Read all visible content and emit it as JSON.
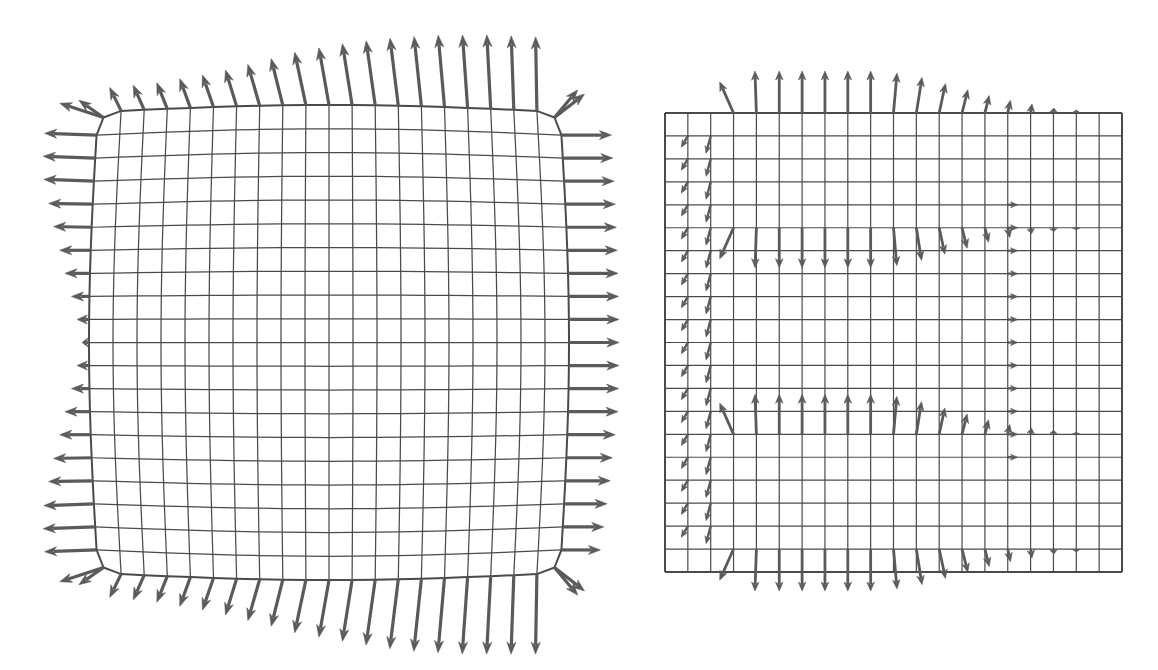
{
  "figure": {
    "width": 1158,
    "height": 670,
    "background": "#ffffff",
    "kind": "vector-field-on-deformed-mesh",
    "panel_count": 2,
    "stroke_color": "#555555",
    "grid_color": "#4a4a4a",
    "arrow_color": "#5a5a5a"
  },
  "chart_data": {
    "type": "quiver",
    "title": "",
    "subtitle": "",
    "xlabel": "",
    "ylabel": "",
    "grid": true,
    "legend": "none",
    "panels": [
      {
        "name": "left-panel",
        "label": "",
        "description": "Bulged/deformed square mesh with outward-pointing traction arrows attached only to the boundary nodes",
        "mesh": {
          "nx": 20,
          "ny": 20,
          "x0": 98,
          "y0": 112,
          "x1": 560,
          "y1": 573,
          "bulge_x": 9,
          "bulge_y": 7,
          "corner_cut": 10
        },
        "arrows": {
          "color": "#5a5a5a",
          "head_len": 12,
          "head_w": 9,
          "shaft_w": 3.2,
          "edges": [
            {
              "edge": "left",
              "direction_deg": 180,
              "count": 21,
              "lengths": [
                46,
                52,
                52,
                50,
                44,
                38,
                31,
                25,
                18,
                12,
                7,
                12,
                18,
                25,
                31,
                38,
                44,
                50,
                52,
                52,
                46
              ],
              "tilt_deg": [
                18,
                2,
                2,
                2,
                1,
                1,
                0,
                0,
                0,
                0,
                0,
                0,
                0,
                0,
                0,
                -1,
                -1,
                -2,
                -2,
                -2,
                -18
              ]
            },
            {
              "edge": "right",
              "direction_deg": 0,
              "count": 21,
              "lengths": [
                38,
                50,
                50,
                50,
                50,
                50,
                50,
                50,
                50,
                50,
                50,
                50,
                50,
                50,
                48,
                46,
                45,
                43,
                41,
                39,
                38
              ],
              "tilt_deg": [
                -38,
                0,
                0,
                0,
                0,
                0,
                0,
                0,
                0,
                0,
                0,
                0,
                0,
                0,
                0,
                0,
                0,
                0,
                0,
                0,
                38
              ]
            },
            {
              "edge": "top",
              "direction_deg": 270,
              "count": 21,
              "lengths": [
                30,
                26,
                27,
                28,
                31,
                34,
                38,
                43,
                48,
                54,
                58,
                62,
                65,
                68,
                70,
                72,
                73,
                74,
                74,
                74,
                36
              ],
              "tilt_deg": [
                -55,
                -26,
                -24,
                -22,
                -20,
                -19,
                -17,
                -16,
                -14,
                -12,
                -10,
                -9,
                -8,
                -7,
                -6,
                -5,
                -4,
                -3,
                -2,
                -1,
                40
              ]
            },
            {
              "edge": "bottom",
              "direction_deg": 90,
              "count": 21,
              "lengths": [
                30,
                26,
                27,
                28,
                31,
                34,
                38,
                43,
                48,
                54,
                58,
                62,
                66,
                70,
                73,
                75,
                77,
                78,
                79,
                80,
                36
              ],
              "tilt_deg": [
                55,
                26,
                24,
                22,
                20,
                19,
                17,
                16,
                14,
                12,
                10,
                9,
                8,
                7,
                6,
                5,
                4,
                3,
                2,
                1,
                -40
              ]
            }
          ]
        }
      },
      {
        "name": "right-panel",
        "label": "",
        "description": "Regular square mesh with a residual/error vector field concentrated on an inner rectangular interface; arrows point up along the outer top band, down along the inner upper interface, up along the inner lower interface, and down along the outer bottom band",
        "mesh": {
          "nx": 20,
          "ny": 20,
          "x0": 665,
          "y0": 113,
          "x1": 1122,
          "y1": 572
        },
        "arrows": {
          "color": "#5a5a5a",
          "head_len": 9,
          "head_w": 7.5,
          "shaft_w": 2.8,
          "bands": [
            {
              "band": "outer-top",
              "row": 0,
              "direction_deg": 270,
              "cols": [
                3,
                4,
                5,
                6,
                7,
                8,
                9,
                10,
                11,
                12,
                13,
                14,
                15,
                16,
                17,
                18
              ],
              "lengths": [
                34,
                42,
                42,
                42,
                42,
                42,
                42,
                40,
                36,
                30,
                24,
                18,
                13,
                9,
                5,
                3
              ],
              "tilt_deg": [
                -24,
                -2,
                0,
                0,
                0,
                0,
                0,
                5,
                9,
                12,
                14,
                14,
                12,
                9,
                5,
                2
              ]
            },
            {
              "band": "inner-top",
              "row": 5,
              "direction_deg": 90,
              "cols": [
                3,
                4,
                5,
                6,
                7,
                8,
                9,
                10,
                11,
                12,
                13,
                14,
                15,
                16,
                17,
                18
              ],
              "lengths": [
                34,
                40,
                40,
                40,
                40,
                40,
                40,
                38,
                33,
                27,
                21,
                15,
                10,
                6,
                4,
                2
              ],
              "tilt_deg": [
                24,
                2,
                0,
                0,
                0,
                0,
                0,
                -5,
                -9,
                -12,
                -14,
                -14,
                -12,
                -9,
                -5,
                -2
              ]
            },
            {
              "band": "inner-bottom",
              "row": 14,
              "direction_deg": 270,
              "cols": [
                3,
                4,
                5,
                6,
                7,
                8,
                9,
                10,
                11,
                12,
                13,
                14,
                15,
                16,
                17,
                18
              ],
              "lengths": [
                34,
                40,
                40,
                40,
                40,
                40,
                40,
                38,
                33,
                27,
                21,
                15,
                10,
                6,
                4,
                2
              ],
              "tilt_deg": [
                -24,
                -2,
                0,
                0,
                0,
                0,
                0,
                5,
                9,
                12,
                14,
                14,
                12,
                9,
                5,
                2
              ]
            },
            {
              "band": "outer-bottom",
              "row": 19,
              "direction_deg": 90,
              "cols": [
                3,
                4,
                5,
                6,
                7,
                8,
                9,
                10,
                11,
                12,
                13,
                14,
                15,
                16,
                17,
                18
              ],
              "lengths": [
                34,
                42,
                42,
                42,
                42,
                42,
                42,
                40,
                36,
                30,
                24,
                18,
                13,
                9,
                5,
                3
              ],
              "tilt_deg": [
                24,
                2,
                0,
                0,
                0,
                0,
                0,
                -5,
                -9,
                -12,
                -14,
                -14,
                -12,
                -9,
                -5,
                -2
              ]
            },
            {
              "band": "left-outer-column",
              "col": 1,
              "direction_deg": 120,
              "rows": [
                1,
                2,
                3,
                4,
                5,
                6,
                7,
                8,
                9,
                10,
                11,
                12,
                13,
                14,
                15,
                16,
                17,
                18
              ],
              "length": 13
            },
            {
              "band": "left-inner-column",
              "col": 2,
              "direction_deg": 105,
              "rows": [
                1,
                2,
                3,
                4,
                5,
                6,
                7,
                8,
                9,
                10,
                11,
                12,
                13,
                14,
                15,
                16,
                17,
                18
              ],
              "length": 18
            },
            {
              "band": "right-column",
              "col": 15,
              "direction_deg": 0,
              "rows": [
                4,
                5,
                6,
                7,
                8,
                9,
                10,
                11,
                12,
                13,
                14,
                15
              ],
              "length": 10
            }
          ]
        }
      }
    ]
  }
}
